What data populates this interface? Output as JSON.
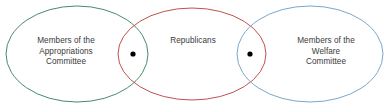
{
  "diagram": {
    "type": "euler-venn",
    "title": "",
    "background_color": "#ffffff",
    "text_color": "#3a3a3a",
    "sets": [
      {
        "id": "appropriations",
        "label": "Members of the\nAppropriations\nCommittee",
        "color": "#4a8a6a",
        "position": "left"
      },
      {
        "id": "republicans",
        "label": "Republicans",
        "color": "#c0504d",
        "position": "middle"
      },
      {
        "id": "welfare",
        "label": "Members of the\nWelfare\nCommittee",
        "color": "#7ba7c7",
        "position": "right"
      }
    ],
    "markers": [
      {
        "id": "marker-left-overlap",
        "in_sets": [
          "appropriations",
          "republicans"
        ],
        "symbol": "dot",
        "color": "#000000",
        "x": 133,
        "y": 54
      },
      {
        "id": "marker-right-overlap",
        "in_sets": [
          "republicans",
          "welfare"
        ],
        "symbol": "dot",
        "color": "#000000",
        "x": 250,
        "y": 54
      }
    ],
    "geometry": {
      "left_ellipse": {
        "cx": 77,
        "cy": 54,
        "rx": 71,
        "ry": 48
      },
      "middle_ellipse": {
        "cx": 192,
        "cy": 54,
        "rx": 74,
        "ry": 46
      },
      "right_ellipse": {
        "cx": 310,
        "cy": 54,
        "rx": 73,
        "ry": 48
      }
    }
  }
}
